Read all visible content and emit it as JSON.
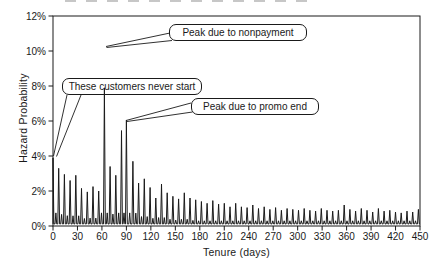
{
  "figure": {
    "background": "#ffffff",
    "ink_color": "#1a1a1a"
  },
  "chart_data": {
    "type": "line",
    "title": "",
    "xlabel": "Tenure (days)",
    "ylabel": "Hazard Probability",
    "xlim": [
      0,
      450
    ],
    "ylim_pct": [
      0,
      12
    ],
    "grid": false,
    "legend": "none",
    "x_ticks": [
      0,
      30,
      60,
      90,
      120,
      150,
      180,
      210,
      240,
      270,
      300,
      330,
      360,
      390,
      420,
      450
    ],
    "y_ticks_pct": [
      0,
      2,
      4,
      6,
      8,
      10,
      12
    ],
    "y_tick_labels": [
      "0%",
      "2%",
      "4%",
      "6%",
      "8%",
      "10%",
      "12%"
    ],
    "series_name": "hazard probability",
    "baseline_pct": 0.12,
    "weekly_spikes": [
      [
        0,
        3.9
      ],
      [
        7,
        3.3
      ],
      [
        14,
        2.95
      ],
      [
        21,
        2.6
      ],
      [
        28,
        2.9
      ],
      [
        35,
        2.15
      ],
      [
        42,
        1.95
      ],
      [
        49,
        2.25
      ],
      [
        56,
        2.0
      ],
      [
        63,
        7.9
      ],
      [
        70,
        3.4
      ],
      [
        77,
        2.9
      ],
      [
        84,
        5.45
      ],
      [
        90,
        6.05
      ],
      [
        98,
        3.7
      ],
      [
        105,
        2.45
      ],
      [
        112,
        2.7
      ],
      [
        119,
        2.2
      ],
      [
        126,
        1.6
      ],
      [
        133,
        2.4
      ],
      [
        140,
        1.9
      ],
      [
        147,
        1.7
      ],
      [
        154,
        1.55
      ],
      [
        161,
        1.9
      ],
      [
        168,
        1.6
      ],
      [
        175,
        1.5
      ],
      [
        182,
        1.4
      ],
      [
        189,
        1.3
      ],
      [
        196,
        1.45
      ],
      [
        203,
        1.25
      ],
      [
        210,
        1.3
      ],
      [
        217,
        1.1
      ],
      [
        224,
        1.3
      ],
      [
        231,
        1.1
      ],
      [
        238,
        1.05
      ],
      [
        245,
        1.2
      ],
      [
        252,
        1.0
      ],
      [
        259,
        1.1
      ],
      [
        266,
        0.95
      ],
      [
        273,
        1.05
      ],
      [
        280,
        0.9
      ],
      [
        287,
        1.0
      ],
      [
        294,
        0.95
      ],
      [
        301,
        0.9
      ],
      [
        308,
        1.0
      ],
      [
        315,
        0.9
      ],
      [
        322,
        0.85
      ],
      [
        329,
        1.0
      ],
      [
        336,
        0.9
      ],
      [
        343,
        0.85
      ],
      [
        350,
        0.9
      ],
      [
        357,
        1.2
      ],
      [
        364,
        0.95
      ],
      [
        371,
        0.85
      ],
      [
        378,
        1.0
      ],
      [
        385,
        0.9
      ],
      [
        392,
        0.8
      ],
      [
        399,
        1.0
      ],
      [
        406,
        0.85
      ],
      [
        413,
        0.9
      ],
      [
        420,
        0.8
      ],
      [
        427,
        0.75
      ],
      [
        434,
        0.85
      ],
      [
        441,
        0.8
      ],
      [
        448,
        0.95
      ]
    ],
    "annotations": [
      {
        "label": "Peak due to nonpayment",
        "points_to_day": 63,
        "points_to_pct": 7.9
      },
      {
        "label": "These customers never start",
        "points_to_day": 0,
        "points_to_pct": 3.9
      },
      {
        "label": "Peak due to promo end",
        "points_to_day": 90,
        "points_to_pct": 6.0
      }
    ]
  }
}
